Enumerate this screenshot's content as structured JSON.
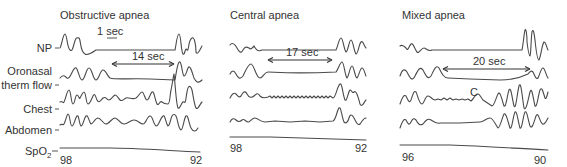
{
  "row_labels": {
    "np": "NP",
    "oronasal_1": "Oronasal",
    "oronasal_2": "therm flow",
    "chest": "Chest",
    "abdomen": "Abdomen",
    "spo2": "SpO",
    "spo2_sub": "2"
  },
  "scale_bar": {
    "label": "1 sec"
  },
  "panels": [
    {
      "title": "Obstructive apnea",
      "duration": "14 sec",
      "spo2_start": "98",
      "spo2_end": "92"
    },
    {
      "title": "Central apnea",
      "duration": "17 sec",
      "spo2_start": "98",
      "spo2_end": "92"
    },
    {
      "title": "Mixed apnea",
      "duration": "20 sec",
      "spo2_start": "96",
      "spo2_end": "90",
      "annotation": "C"
    }
  ],
  "colors": {
    "trace": "#4a4a4a",
    "text": "#333333"
  }
}
